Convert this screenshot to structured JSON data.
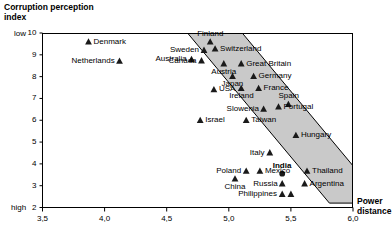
{
  "chart_data": {
    "type": "scatter",
    "title": "",
    "ylabel": "Corruption perception index",
    "xlabel": "Power distance",
    "xlim": [
      3.5,
      6.0
    ],
    "ylim": [
      2,
      10
    ],
    "grid": false,
    "legend": "none",
    "y_axis_low_label": "low",
    "y_axis_high_label": "high",
    "y_ticks": [
      10,
      9,
      8,
      7,
      6,
      5,
      4,
      3,
      2
    ],
    "x_ticks": [
      "3,5",
      "4,0",
      "4,5",
      "5,0",
      "5,5",
      "6,0"
    ],
    "x_tick_values": [
      3.5,
      4.0,
      4.5,
      5.0,
      5.5,
      6.0
    ],
    "band": {
      "fill": "#c9c9c9",
      "stroke": "#000000",
      "description": "shaded correlation band from upper-left to lower-right"
    },
    "points": [
      {
        "label": "Denmark",
        "x": 3.87,
        "y": 9.6,
        "label_side": "right",
        "marker": "triangle",
        "emphasis": false
      },
      {
        "label": "Netherlands",
        "x": 4.12,
        "y": 8.72,
        "label_side": "left",
        "marker": "triangle",
        "emphasis": false
      },
      {
        "label": "Finland",
        "x": 4.85,
        "y": 9.6,
        "label_side": "above",
        "marker": "triangle",
        "emphasis": false
      },
      {
        "label": "Sweden",
        "x": 4.8,
        "y": 9.22,
        "label_side": "left",
        "marker": "triangle",
        "emphasis": false
      },
      {
        "label": "Switzerland",
        "x": 4.89,
        "y": 9.28,
        "label_side": "right",
        "marker": "triangle",
        "emphasis": false
      },
      {
        "label": "Australia",
        "x": 4.7,
        "y": 8.8,
        "label_side": "left",
        "marker": "triangle",
        "emphasis": false
      },
      {
        "label": "Canada",
        "x": 4.78,
        "y": 8.74,
        "label_side": "left",
        "marker": "triangle",
        "emphasis": false
      },
      {
        "label": "Austria",
        "x": 4.96,
        "y": 8.6,
        "label_side": "below",
        "marker": "triangle",
        "emphasis": false
      },
      {
        "label": "Great Britain",
        "x": 5.1,
        "y": 8.6,
        "label_side": "right",
        "marker": "triangle",
        "emphasis": false
      },
      {
        "label": "Japan",
        "x": 5.03,
        "y": 8.02,
        "label_side": "below",
        "marker": "triangle",
        "emphasis": false
      },
      {
        "label": "Germany",
        "x": 5.2,
        "y": 8.02,
        "label_side": "right",
        "marker": "triangle",
        "emphasis": false
      },
      {
        "label": "USA",
        "x": 4.88,
        "y": 7.42,
        "label_side": "right",
        "marker": "triangle",
        "emphasis": false
      },
      {
        "label": "Ireland",
        "x": 5.1,
        "y": 7.47,
        "label_side": "below",
        "marker": "triangle",
        "emphasis": false
      },
      {
        "label": "France",
        "x": 5.24,
        "y": 7.47,
        "label_side": "right",
        "marker": "triangle",
        "emphasis": false
      },
      {
        "label": "Spain",
        "x": 5.48,
        "y": 6.74,
        "label_side": "above",
        "marker": "triangle",
        "emphasis": false
      },
      {
        "label": "Portugal",
        "x": 5.4,
        "y": 6.62,
        "label_side": "right",
        "marker": "triangle",
        "emphasis": false
      },
      {
        "label": "Slowenia",
        "x": 5.28,
        "y": 6.52,
        "label_side": "left",
        "marker": "triangle",
        "emphasis": false
      },
      {
        "label": "Israel",
        "x": 4.77,
        "y": 6.0,
        "label_side": "right",
        "marker": "triangle",
        "emphasis": false
      },
      {
        "label": "Taiwan",
        "x": 5.14,
        "y": 6.0,
        "label_side": "right",
        "marker": "triangle",
        "emphasis": false
      },
      {
        "label": "Hungary",
        "x": 5.54,
        "y": 5.32,
        "label_side": "right",
        "marker": "triangle",
        "emphasis": false
      },
      {
        "label": "Italy",
        "x": 5.33,
        "y": 4.52,
        "label_side": "left",
        "marker": "triangle",
        "emphasis": false
      },
      {
        "label": "Poland",
        "x": 5.14,
        "y": 3.68,
        "label_side": "left",
        "marker": "triangle",
        "emphasis": false
      },
      {
        "label": "Mexico",
        "x": 5.25,
        "y": 3.68,
        "label_side": "right",
        "marker": "triangle",
        "emphasis": false
      },
      {
        "label": "India",
        "x": 5.43,
        "y": 3.55,
        "label_side": "above",
        "marker": "circle",
        "emphasis": true
      },
      {
        "label": "Thailand",
        "x": 5.63,
        "y": 3.68,
        "label_side": "right",
        "marker": "triangle",
        "emphasis": false
      },
      {
        "label": "China",
        "x": 5.05,
        "y": 3.32,
        "label_side": "below",
        "marker": "triangle",
        "emphasis": false
      },
      {
        "label": "Russia",
        "x": 5.43,
        "y": 3.1,
        "label_side": "left",
        "marker": "triangle",
        "emphasis": false
      },
      {
        "label": "Argentina",
        "x": 5.61,
        "y": 3.1,
        "label_side": "right",
        "marker": "triangle",
        "emphasis": false
      },
      {
        "label": "Philippines",
        "x": 5.43,
        "y": 2.62,
        "label_side": "left",
        "marker": "triangle",
        "emphasis": false
      },
      {
        "label": "",
        "x": 5.5,
        "y": 2.62,
        "label_side": "none",
        "marker": "triangle",
        "emphasis": false
      }
    ]
  },
  "labels": {
    "y_title": "Corruption perception\nindex",
    "x_title": "Power\ndistance",
    "low": "low",
    "high": "high"
  }
}
